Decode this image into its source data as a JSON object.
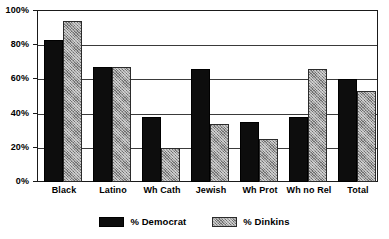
{
  "chart_data": {
    "type": "bar",
    "title": "",
    "subtitle": "",
    "xlabel": "",
    "ylabel": "",
    "ylim": [
      0,
      100
    ],
    "y_tick_labels": [
      "0%",
      "20%",
      "40%",
      "60%",
      "80%",
      "100%"
    ],
    "y_tick_values": [
      0,
      20,
      40,
      60,
      80,
      100
    ],
    "grid": true,
    "legend_position": "bottom-center",
    "categories": [
      "Black",
      "Latino",
      "Wh Cath",
      "Jewish",
      "Wh Prot",
      "Wh no Rel",
      "Total"
    ],
    "series": [
      {
        "name": "% Democrat",
        "color": "#0d0d0d",
        "pattern": "solid",
        "values": [
          83,
          67,
          38,
          66,
          35,
          38,
          60
        ]
      },
      {
        "name": "% Dinkins",
        "color": "#9a9a9a",
        "pattern": "crosshatch",
        "values": [
          94,
          67,
          20,
          34,
          25,
          66,
          53
        ]
      }
    ]
  },
  "legend": {
    "entries": [
      {
        "label": "% Democrat"
      },
      {
        "label": "% Dinkins"
      }
    ]
  }
}
